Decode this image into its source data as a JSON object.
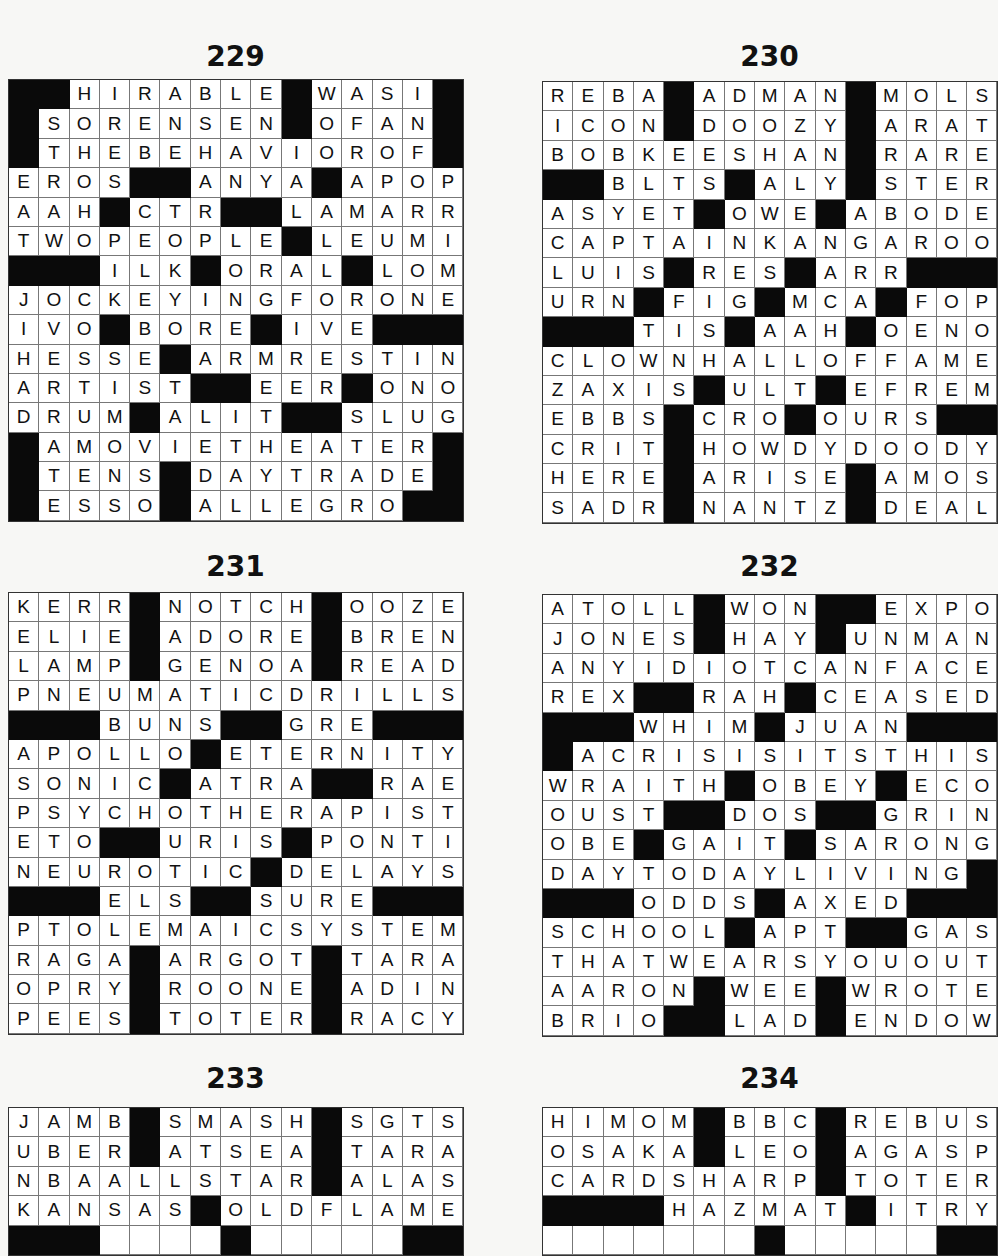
{
  "puzzles": [
    {
      "number": "229",
      "rows": [
        "##HIRABLE#WASI#",
        "#SORENSEN#OFAN#",
        "#THEBEHAVIOROF#",
        "EROS##ANYA#APOP",
        "AAH#CTR##LAMARR",
        "TWOPEOPLE#LEUMI",
        "###ILK#ORAL#LOM",
        "JOCKEYINGFORONE",
        "IVO#BORE#IVE###",
        "HESSE#ARMRESTIN",
        "ARTIST##EER#ONO",
        "DRUM#ALIT##SLUG",
        "#AMOVIETHEATER#",
        "#TENS#DAYTRADE#",
        "#ESSO#ALLEGRO##"
      ]
    },
    {
      "number": "230",
      "rows": [
        "REBA#ADMAN#MOLS",
        "ICON#DOOZY#ARAT",
        "BOBKEESHAN#RARE",
        "##BLTS#ALY#STER",
        "ASYET#OWE#ABODE",
        "CAPTAINKANGAROO",
        "LUIS#RES#ARR###",
        "URN#FIG#MCA#FOP",
        "###TIS#AAH#OENO",
        "CLOWNHALLOFFAME",
        "ZAXIS#ULT#EFREM",
        "EBBS#CRO#OURS##",
        "CRIT#HOWDYDOODY",
        "HERE#ARISE#AMOS",
        "SADR#NANTZ#DEAL"
      ]
    },
    {
      "number": "231",
      "rows": [
        "KERR#NOTCH#OOZE",
        "ELIE#ADORE#BREN",
        "LAMP#GENOA#READ",
        "PNEUMATICDRILLS",
        "###BUNS##GRE###",
        "APOLLO#ETERNITY",
        "SONIC#ATRA##RAE",
        "PSYCHOTHERAPIST",
        "ETO##URIS#PONTI",
        "NEUROTIC#DELAYS",
        "###ELS##SURE###",
        "PTOLEMAICSYSTEM",
        "RAGA#ARGOT#TARA",
        "OPRY#ROONE#ADIN",
        "PEES#TOTER#RACY"
      ]
    },
    {
      "number": "232",
      "rows": [
        "ATOLL#WON##EXPO",
        "JONES#HAY#UNMAN",
        "ANYIDIOTCANFACE",
        "REX##RAH#CEASED",
        "###WHIM#JUAN###",
        "#ACRISISITSTHIS",
        "WRAITH#OBEY#ECO",
        "OUST##DOS##GRIN",
        "OBE#GAIT#SARONG",
        "DAYTODAYLIVING#",
        "###ODDS#AXED###",
        "SCHOOL#APT##GAS",
        "THATWEARSYOUOUT",
        "AARON#WEE#WROTE",
        "BRIO##LAD#ENDOW"
      ]
    },
    {
      "number": "233",
      "rows": [
        "JAMB#SMASH#SGTS",
        "UBER#ATSEA#TARA",
        "NBAALLSTAR#ALAS",
        "KANSAS#OLDFLAME",
        "###    #     ##"
      ]
    },
    {
      "number": "234",
      "rows": [
        "HIMOM#BBC#REBUS",
        "OSAKA#LEO#AGASP",
        "CARDSHARP#TOTER",
        "####HAZMAT#ITRY",
        "       #     ##"
      ]
    }
  ]
}
